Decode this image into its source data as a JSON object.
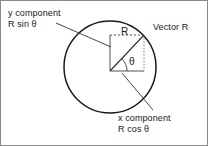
{
  "figure": {
    "stroke_color": "#1a1a1a",
    "background": "#ffffff"
  },
  "labels": {
    "y_component": {
      "line1": "y component",
      "line2": "R sin θ"
    },
    "x_component": {
      "line1": "x component",
      "line2": "R cos θ"
    },
    "vector_r": "Vector R",
    "radius": "R",
    "angle": "θ"
  },
  "geometry": {
    "circle": {
      "cx": 109,
      "cy": 66,
      "r": 46
    },
    "origin": {
      "x": 109,
      "y": 70
    },
    "tip": {
      "x": 143,
      "y": 34
    },
    "box": {
      "left": 109,
      "top": 34,
      "right": 143,
      "bottom": 70
    },
    "leader_y": {
      "x1": 55,
      "y1": 22,
      "x2": 110,
      "y2": 46
    },
    "leader_x": {
      "x1": 152,
      "y1": 109,
      "x2": 121,
      "y2": 72
    }
  }
}
